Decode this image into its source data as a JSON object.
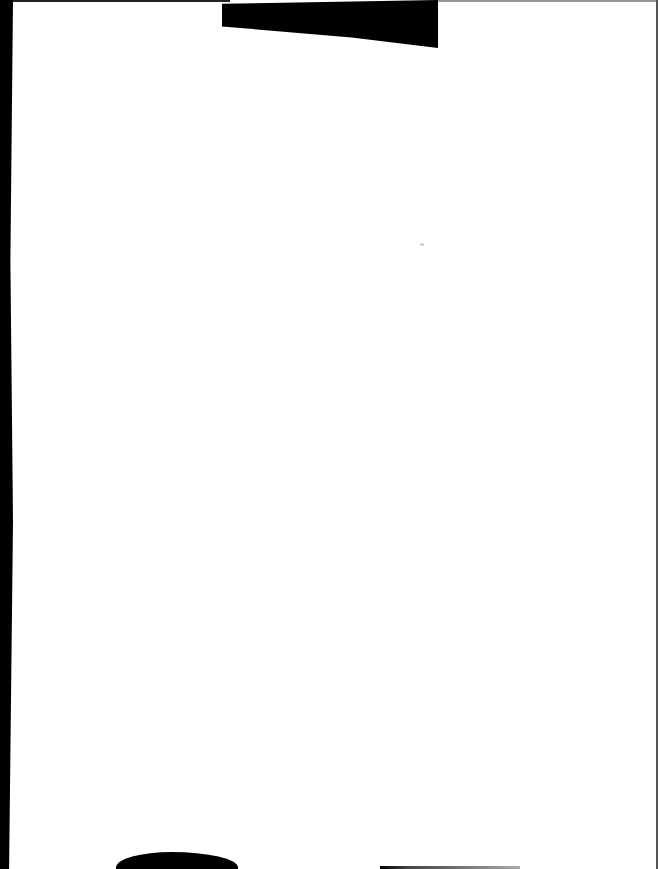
{
  "document": {
    "type": "scanned-page",
    "content": "",
    "background_color": "#ffffff",
    "edge_color": "#000000"
  }
}
